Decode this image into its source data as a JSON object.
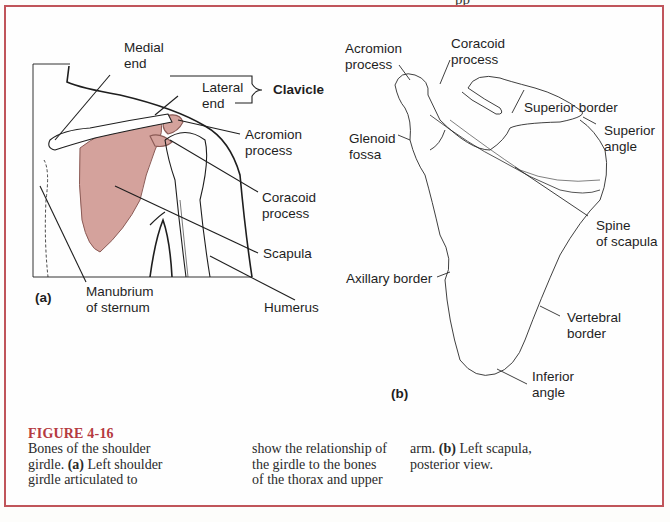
{
  "page_header_fragment": "pp",
  "figure": {
    "number": "FIGURE 4-16",
    "caption_columns": [
      [
        "Bones of the shoulder",
        "girdle. (a) Left shoulder",
        "girdle articulated to"
      ],
      [
        "show the relationship of",
        "the girdle to the bones",
        "of the thorax and upper"
      ],
      [
        "arm. (b) Left scapula,",
        "posterior view."
      ]
    ],
    "caption_full": "Bones of the shoulder girdle. (a) Left shoulder girdle articulated to show the relationship of the girdle to the bones of the thorax and upper arm. (b) Left scapula, posterior view."
  },
  "panel_a": {
    "tag": "(a)",
    "labels": {
      "medial_end": [
        "Medial",
        "end"
      ],
      "lateral_end": [
        "Lateral",
        "end"
      ],
      "clavicle": "Clavicle",
      "acromion": [
        "Acromion",
        "process"
      ],
      "coracoid": [
        "Coracoid",
        "process"
      ],
      "scapula": "Scapula",
      "humerus": "Humerus",
      "manubrium": [
        "Manubrium",
        "of sternum"
      ]
    },
    "colors": {
      "scapula_fill": "#d4a29c",
      "outline": "#1e1e1e"
    }
  },
  "panel_b": {
    "tag": "(b)",
    "labels": {
      "acromion": [
        "Acromion",
        "process"
      ],
      "coracoid": [
        "Coracoid",
        "process"
      ],
      "superior_border": "Superior border",
      "superior_angle": [
        "Superior",
        "angle"
      ],
      "glenoid": [
        "Glenoid",
        "fossa"
      ],
      "spine": [
        "Spine",
        "of scapula"
      ],
      "axillary_border": "Axillary border",
      "vertebral_border": [
        "Vertebral",
        "border"
      ],
      "inferior_angle": [
        "Inferior",
        "angle"
      ]
    }
  },
  "colors": {
    "frame": "#c0555a",
    "figure_title": "#b53a40"
  }
}
